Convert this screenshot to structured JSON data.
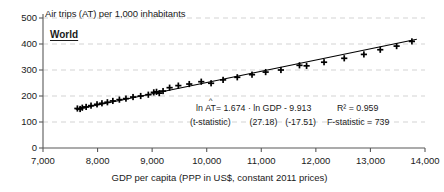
{
  "chart_data": {
    "type": "scatter",
    "title": "Air trips (AT) per 1,000 inhabitants",
    "region_label": "World",
    "xlabel": "GDP per capita (PPP in US$, constant 2011 prices)",
    "ylabel": "Air trips (AT) per 1,000 inhabitants",
    "xlim": [
      7000,
      14000
    ],
    "ylim": [
      0,
      500
    ],
    "xticks": [
      7000,
      8000,
      9000,
      10000,
      11000,
      12000,
      13000,
      14000
    ],
    "xticklabels": [
      "7,000",
      "8,000",
      "9,000",
      "10,000",
      "11,000",
      "12,000",
      "13,000",
      "14,000"
    ],
    "yticks": [
      0,
      100,
      200,
      300,
      400,
      500
    ],
    "yticklabels": [
      "0",
      "100",
      "200",
      "300",
      "400",
      "500"
    ],
    "grid": "horizontal-dashed",
    "legend": "none",
    "marker": "plus",
    "series": [
      {
        "name": "Air trips vs GDP per capita",
        "x": [
          7630,
          7680,
          7720,
          7790,
          7880,
          7990,
          8080,
          8180,
          8280,
          8400,
          8520,
          8650,
          8790,
          8930,
          9030,
          9080,
          9130,
          9200,
          9320,
          9480,
          9680,
          9900,
          10080,
          10300,
          10560,
          10830,
          11080,
          11360,
          11700,
          11830,
          12150,
          12520,
          12880,
          13180,
          13480,
          13760
        ],
        "y": [
          152,
          150,
          155,
          158,
          163,
          168,
          172,
          176,
          181,
          186,
          190,
          196,
          200,
          205,
          214,
          216,
          211,
          219,
          232,
          240,
          246,
          255,
          249,
          262,
          272,
          282,
          292,
          300,
          318,
          316,
          330,
          345,
          360,
          378,
          392,
          410
        ]
      }
    ],
    "fit_line": {
      "type": "regression",
      "equation_lhs": "ln AT",
      "equation": "= 1.674 · ln GDP - 9.913",
      "slope": 1.674,
      "intercept": -9.913,
      "stat_label": "(t-statistic)",
      "t_slope": "(27.18)",
      "t_intercept": "(-17.51)",
      "r_squared_label": "R² = 0.959",
      "r_squared": 0.959,
      "f_statistic_label": "F-statistic = 739",
      "f_statistic": 739,
      "x_start": 7600,
      "y_start": 148,
      "x_end": 13850,
      "y_end": 418
    }
  },
  "colors": {
    "axis": "#595959",
    "grid": "#c8c8c8",
    "marker": "#000000",
    "line": "#000000",
    "text": "#1a1a1a",
    "background": "#ffffff"
  }
}
